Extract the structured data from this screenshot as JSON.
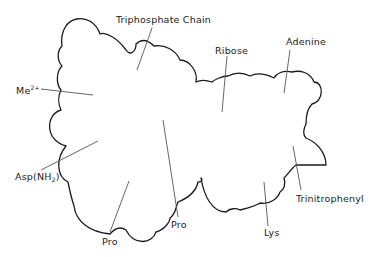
{
  "figure": {
    "outline_color": "#1a1a1a",
    "leader_color": "#555555",
    "labels": {
      "triphosphate_chain": "Triphosphate Chain",
      "ribose": "Ribose",
      "adenine": "Adenine",
      "me_base": "Me",
      "me_charge": "2+",
      "asp_prefix": "Asp(NH",
      "asp_sub": "2",
      "asp_suffix": ")",
      "pro_left": "Pro",
      "pro_right": "Pro",
      "lys": "Lys",
      "trinitrophenyl": "Trinitrophenyl"
    }
  }
}
